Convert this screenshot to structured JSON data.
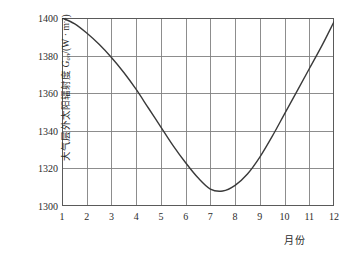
{
  "chart_data": {
    "type": "line",
    "title": "",
    "subtitle": "",
    "xlabel": "月份",
    "ylabel": "大气层外太阳辐射度 Gon/(W · m-2)",
    "ylabel_parts": {
      "cjk_prefix": "大气层外太阳辐射度 ",
      "symbol": "G",
      "symbol_sub": "on",
      "unit_open": "/(W · m",
      "unit_exp": "-2",
      "unit_close": ")"
    },
    "xlim": [
      1,
      12
    ],
    "ylim": [
      1300,
      1400
    ],
    "grid": true,
    "legend": null,
    "legend_position": "none",
    "line_color": "#3a3a3a",
    "grid_color": "#808080",
    "axis_color": "#5a5a5a",
    "background_color": "#ffffff",
    "x_ticks": [
      "1",
      "2",
      "3",
      "4",
      "5",
      "6",
      "7",
      "8",
      "9",
      "10",
      "11",
      "12"
    ],
    "x_tick_values": [
      1,
      2,
      3,
      4,
      5,
      6,
      7,
      8,
      9,
      10,
      11,
      12
    ],
    "y_ticks": [
      "1300",
      "1320",
      "1340",
      "1360",
      "1380",
      "1400"
    ],
    "y_tick_values": [
      1300,
      1320,
      1340,
      1360,
      1380,
      1400
    ],
    "series": [
      {
        "name": "Gon",
        "x": [
          1,
          1.5,
          2,
          2.5,
          3,
          3.5,
          4,
          4.5,
          5,
          5.5,
          6,
          6.5,
          7,
          7.5,
          8,
          8.5,
          9,
          9.5,
          10,
          10.5,
          11,
          11.5,
          12
        ],
        "values": [
          1400,
          1397,
          1392,
          1386,
          1379,
          1371,
          1362,
          1352,
          1342,
          1332,
          1323,
          1315,
          1309,
          1308,
          1311,
          1317,
          1326,
          1337,
          1349,
          1361,
          1373,
          1385,
          1398
        ]
      }
    ],
    "annotations": [],
    "notes": {
      "max_value": 1400,
      "max_at_month": 1,
      "min_value": 1308,
      "min_at_month": 7
    }
  }
}
